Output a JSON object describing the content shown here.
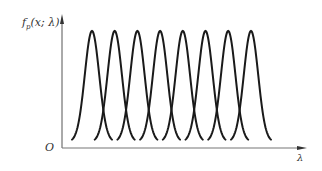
{
  "chart_data": {
    "type": "line",
    "title": "",
    "xlabel": "λ",
    "ylabel": "fp(x; λ)",
    "ylabel_main": "f",
    "ylabel_sub": "p",
    "ylabel_args": "(x; λ)",
    "origin_label": "O",
    "grid": false,
    "legend": "none",
    "series_count": 8,
    "peak_positions_px": [
      92,
      114.7,
      137.4,
      160.1,
      182.8,
      205.5,
      228.2,
      251
    ],
    "peak_height_relative": 1.0,
    "curve_color": "#1a1a1a",
    "axis_color": "#555555",
    "xlim": [
      0,
      1
    ],
    "ylim": [
      0,
      1
    ]
  }
}
